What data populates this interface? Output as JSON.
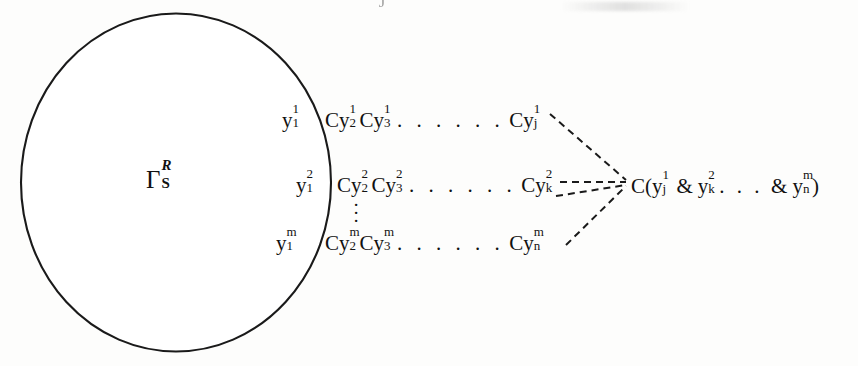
{
  "figure": {
    "artifact_text": "ˉJ",
    "region": {
      "label_base": "Γ",
      "label_superscript": "R",
      "label_subscript": "S",
      "shape": "circle",
      "stroke_color": "#1a1a1a",
      "fill_color": "#ffffff"
    },
    "rows": [
      {
        "row_label": {
          "lead": "y",
          "sup": "1",
          "sub": "1"
        },
        "terms": [
          {
            "lead": "Cy",
            "sup": "1",
            "sub": "2"
          },
          {
            "lead": "Cy",
            "sup": "1",
            "sub": "3"
          }
        ],
        "dots": ". . . . . .",
        "last_term": {
          "lead": "Cy",
          "sup": "1",
          "sub": "j"
        }
      },
      {
        "row_label": {
          "lead": "y",
          "sup": "2",
          "sub": "1"
        },
        "terms": [
          {
            "lead": "Cy",
            "sup": "2",
            "sub": "2"
          },
          {
            "lead": "Cy",
            "sup": "2",
            "sub": "3"
          }
        ],
        "dots": ". . . . . .",
        "last_term": {
          "lead": "Cy",
          "sup": "2",
          "sub": "k"
        }
      },
      {
        "row_label": {
          "lead": "y",
          "sup": "m",
          "sub": "1"
        },
        "terms": [
          {
            "lead": "Cy",
            "sup": "m",
            "sub": "2"
          },
          {
            "lead": "Cy",
            "sup": "m",
            "sub": "3"
          }
        ],
        "dots": ". . . . . .",
        "last_term": {
          "lead": "Cy",
          "sup": "m",
          "sub": "n"
        }
      }
    ],
    "vertical_ellipsis": "⋮",
    "conclusion": {
      "prefix": "C(",
      "operand1": {
        "lead": "y",
        "sup": "1",
        "sub": "j"
      },
      "amp1": "&",
      "operand2": {
        "lead": "y",
        "sup": "2",
        "sub": "k"
      },
      "hdots": ". . .",
      "amp2": "&",
      "operand3": {
        "lead": "y",
        "sup": "m",
        "sub": "n"
      },
      "suffix": ")"
    },
    "connector_style": "dashed",
    "connector_color": "#1a1a1a"
  }
}
